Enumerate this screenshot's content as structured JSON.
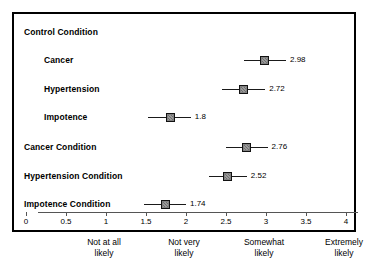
{
  "chart_data": {
    "type": "scatter",
    "title": "",
    "xlabel": "",
    "ylabel": "",
    "xlim": [
      0,
      4
    ],
    "grid": false,
    "legend": null,
    "orientation": "horizontal",
    "marker": "filled-square-with-error-bars",
    "xticks": [
      "0",
      "0.5",
      "1",
      "1.5",
      "2",
      "2.5",
      "3",
      "3.5",
      "4"
    ],
    "xtick_values": [
      0,
      0.5,
      1,
      1.5,
      2,
      2.5,
      3,
      3.5,
      4
    ],
    "anchors": [
      {
        "value": 1,
        "line1": "Not at all",
        "line2": "likely"
      },
      {
        "value": 2,
        "line1": "Not very",
        "line2": "likely"
      },
      {
        "value": 3,
        "line1": "Somewhat",
        "line2": "likely"
      },
      {
        "value": 4,
        "line1": "Extremely",
        "line2": "likely"
      }
    ],
    "rows": [
      {
        "label": "Control Condition",
        "style": "group-header",
        "value": null,
        "value_label": "",
        "low": null,
        "high": null
      },
      {
        "label": "Cancer",
        "style": "indented",
        "value": 2.98,
        "value_label": "2.98",
        "low": 2.72,
        "high": 3.25
      },
      {
        "label": "Hypertension",
        "style": "indented",
        "value": 2.72,
        "value_label": "2.72",
        "low": 2.45,
        "high": 2.99
      },
      {
        "label": "Impotence",
        "style": "indented",
        "value": 1.8,
        "value_label": "1.8",
        "low": 1.52,
        "high": 2.06
      },
      {
        "label": "Cancer Condition",
        "style": "group",
        "value": 2.76,
        "value_label": "2.76",
        "low": 2.5,
        "high": 3.02
      },
      {
        "label": "Hypertension Condition",
        "style": "group",
        "value": 2.52,
        "value_label": "2.52",
        "low": 2.29,
        "high": 2.76
      },
      {
        "label": "Impotence Condition",
        "style": "group",
        "value": 1.74,
        "value_label": "1.74",
        "low": 1.47,
        "high": 2.0
      }
    ]
  },
  "colors": {
    "frame": "#000000",
    "marker_fill": "#808080",
    "marker_edge": "#111111",
    "axis": "#555555",
    "text": "#000000",
    "background": "#ffffff"
  }
}
